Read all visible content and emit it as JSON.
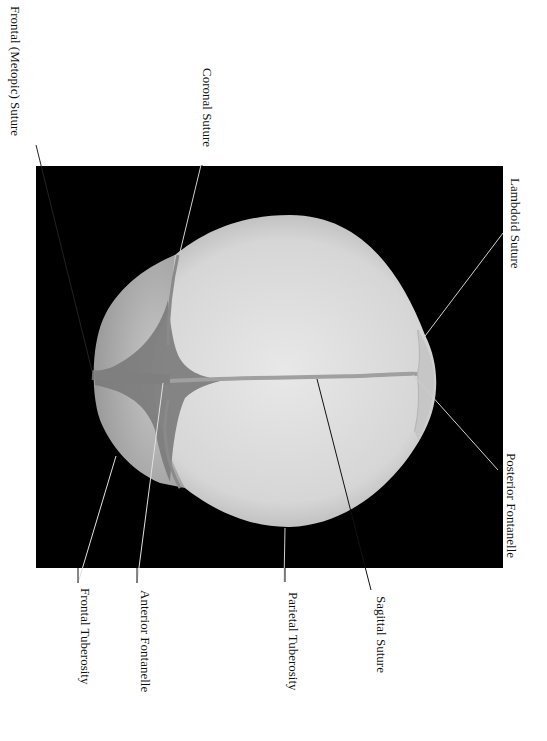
{
  "figure": {
    "background_color": "#000000",
    "bone_color": "#d9d9d9",
    "suture_color": "#8a8a8a"
  },
  "labels": [
    {
      "id": "frontal-metopic-suture",
      "text": "Frontal (Metopic) Suture"
    },
    {
      "id": "coronal-suture",
      "text": "Coronal Suture"
    },
    {
      "id": "lambdoid-suture",
      "text": "Lambdoid Suture"
    },
    {
      "id": "posterior-fontanelle",
      "text": "Posterior Fontanelle"
    },
    {
      "id": "sagittal-suture",
      "text": "Sagittal Suture"
    },
    {
      "id": "parietal-tuberosity",
      "text": "Parietal Tuberosity"
    },
    {
      "id": "anterior-fontanelle",
      "text": "Anterior Fontanelle"
    },
    {
      "id": "frontal-tuberosity",
      "text": "Frontal Tuberosity"
    }
  ]
}
